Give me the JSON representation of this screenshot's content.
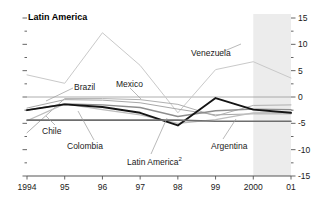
{
  "title": "Latin America",
  "footnote_marker": "2",
  "colors": {
    "background": "#ffffff",
    "axis": "#555555",
    "forecast_shade": "#ececec",
    "zero_line": "#9a9a9a",
    "venezuela": "#c9c9c9",
    "brazil": "#b0b0b0",
    "mexico": "#a8a8a8",
    "chile": "#8d8d8d",
    "colombia": "#bdbdbd",
    "latin_america": "#141414",
    "argentina": "#6e6e6e",
    "text": "#1a1a1a"
  },
  "annotations": [
    {
      "name": "venezuela-label",
      "text": "Venezuela"
    },
    {
      "name": "brazil-label",
      "text": "Brazil"
    },
    {
      "name": "mexico-label",
      "text": "Mexico"
    },
    {
      "name": "chile-label",
      "text": "Chile"
    },
    {
      "name": "colombia-label",
      "text": "Colombia"
    },
    {
      "name": "latin-america-series-label",
      "text": "Latin America"
    },
    {
      "name": "argentina-label",
      "text": "Argentina"
    }
  ],
  "chart_data": {
    "type": "line",
    "title": "Latin America",
    "xlabel": "",
    "ylabel": "",
    "grid": false,
    "legend": "inline-annotations",
    "x": [
      1994,
      1995,
      1996,
      1997,
      1998,
      1999,
      2000,
      2001
    ],
    "xtick_labels": [
      "1994",
      "95",
      "96",
      "97",
      "98",
      "99",
      "2000",
      "01"
    ],
    "ylim": [
      -15,
      15
    ],
    "ytick_labels": [
      "15",
      "10",
      "5",
      "0",
      "-5",
      "-10",
      "-15"
    ],
    "ytick_values": [
      15,
      10,
      5,
      0,
      -5,
      -10,
      -15
    ],
    "yminor_step": 2.5,
    "zero_line": 0,
    "forecast_region": {
      "from": 2000,
      "to": 2001,
      "label": ""
    },
    "series": [
      {
        "name": "Venezuela",
        "values": [
          4.2,
          2.6,
          12.2,
          6.0,
          -3.0,
          5.2,
          6.7,
          3.6
        ],
        "width": 1.0,
        "color_key": "venezuela"
      },
      {
        "name": "Brazil",
        "values": [
          -6.8,
          -0.3,
          -0.3,
          -0.5,
          -1.4,
          -3.6,
          -1.6,
          -1.5
        ],
        "width": 1.0,
        "color_key": "brazil"
      },
      {
        "name": "Mexico",
        "values": [
          -2.1,
          -0.5,
          -0.6,
          -1.1,
          -2.3,
          -3.4,
          -3.2,
          -3.2
        ],
        "width": 1.0,
        "color_key": "mexico"
      },
      {
        "name": "Chile",
        "values": [
          -2.5,
          -1.3,
          -1.5,
          -2.0,
          -3.7,
          -2.6,
          -2.3,
          -2.4
        ],
        "width": 1.4,
        "color_key": "chile"
      },
      {
        "name": "Colombia",
        "values": [
          -4.5,
          -1.3,
          -2.4,
          -3.4,
          -5.0,
          -4.3,
          -3.0,
          -2.9
        ],
        "width": 1.2,
        "color_key": "colombia"
      },
      {
        "name": "Latin America",
        "values": [
          -2.5,
          -1.4,
          -1.9,
          -3.0,
          -5.4,
          -0.2,
          -2.4,
          -3.0
        ],
        "width": 1.9,
        "color_key": "latin_america"
      },
      {
        "name": "Argentina",
        "values": [
          -4.4,
          -4.4,
          -4.4,
          -4.4,
          -4.4,
          -4.6,
          -4.6,
          -4.6
        ],
        "width": 1.6,
        "color_key": "argentina"
      }
    ]
  },
  "axes": {
    "x_axis_name": "year-axis",
    "y_axis_name": "percent-axis"
  }
}
